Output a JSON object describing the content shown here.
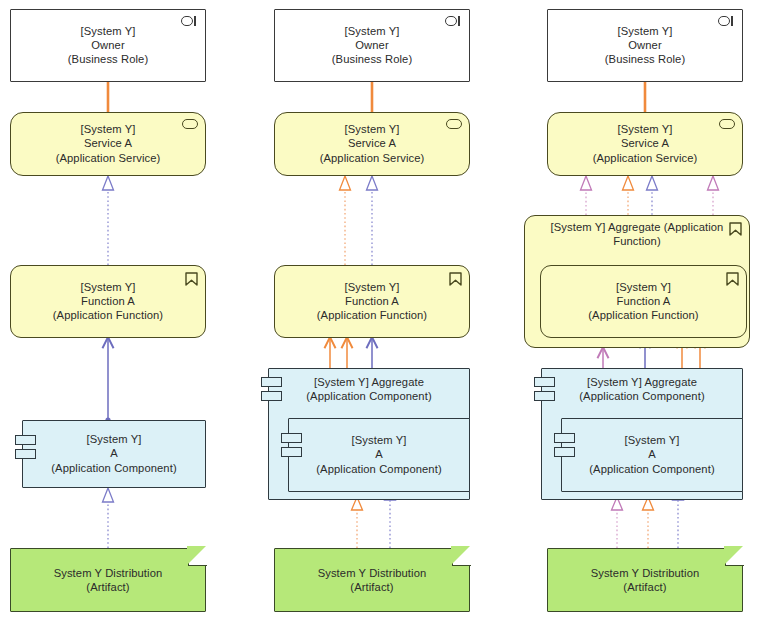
{
  "diagram": {
    "background": "#ffffff",
    "width": 760,
    "height": 622,
    "palette": {
      "business_role_fill": "#ffffff",
      "application_yellow_fill": "#fbfbc4",
      "application_blue_fill": "#dcf1f7",
      "artifact_green_fill": "#b6e879",
      "stroke_dark": "#3a3a3a",
      "assignment_orange": "#f08a3c",
      "realization_blue": "#7b7bc8",
      "realization_orange": "#f08a3c",
      "realization_pink": "#d89ac8",
      "serving_orange": "#f08a3c",
      "serving_blue": "#6d6dbe",
      "serving_pink": "#c07ab8"
    }
  },
  "columns": [
    {
      "id": "column-1",
      "name": "variant-simple",
      "nodes": [
        {
          "id": "c1-owner",
          "type": "business-role",
          "text": "[System Y]\nOwner\n(Business Role)"
        },
        {
          "id": "c1-service-a",
          "type": "application-service",
          "text": "[System Y]\nService A\n(Application Service)"
        },
        {
          "id": "c1-function-a",
          "type": "application-function",
          "text": "[System Y]\nFunction A\n(Application Function)"
        },
        {
          "id": "c1-component-a",
          "type": "application-component",
          "text": "[System Y]\nA\n(Application Component)"
        },
        {
          "id": "c1-artifact",
          "type": "artifact",
          "text": "System Y Distribution\n(Artifact)"
        }
      ]
    },
    {
      "id": "column-2",
      "name": "variant-aggregate-component",
      "nodes": [
        {
          "id": "c2-owner",
          "type": "business-role",
          "text": "[System Y]\nOwner\n(Business Role)"
        },
        {
          "id": "c2-service-a",
          "type": "application-service",
          "text": "[System Y]\nService A\n(Application Service)"
        },
        {
          "id": "c2-function-a",
          "type": "application-function",
          "text": "[System Y]\nFunction A\n(Application Function)"
        },
        {
          "id": "c2-aggregate-comp",
          "type": "application-component",
          "text": "[System Y] Aggregate\n(Application Component)"
        },
        {
          "id": "c2-component-a",
          "type": "application-component",
          "text": "[System Y]\nA\n(Application Component)"
        },
        {
          "id": "c2-artifact",
          "type": "artifact",
          "text": "System Y Distribution\n(Artifact)"
        }
      ]
    },
    {
      "id": "column-3",
      "name": "variant-aggregate-function-and-component",
      "nodes": [
        {
          "id": "c3-owner",
          "type": "business-role",
          "text": "[System Y]\nOwner\n(Business Role)"
        },
        {
          "id": "c3-service-a",
          "type": "application-service",
          "text": "[System Y]\nService A\n(Application Service)"
        },
        {
          "id": "c3-aggregate-func",
          "type": "application-function",
          "text": "[System Y] Aggregate (Application Function)"
        },
        {
          "id": "c3-function-a",
          "type": "application-function",
          "text": "[System Y]\nFunction A\n(Application Function)"
        },
        {
          "id": "c3-aggregate-comp",
          "type": "application-component",
          "text": "[System Y] Aggregate\n(Application Component)"
        },
        {
          "id": "c3-component-a",
          "type": "application-component",
          "text": "[System Y]\nA\n(Application Component)"
        },
        {
          "id": "c3-artifact",
          "type": "artifact",
          "text": "System Y Distribution\n(Artifact)"
        }
      ]
    }
  ],
  "icons": {
    "business_role": "role-cylinder-icon",
    "application_service": "rounded-oval-icon",
    "application_function": "arrow-flag-icon",
    "application_component": "component-bars-icon",
    "artifact": "folded-corner-icon"
  }
}
